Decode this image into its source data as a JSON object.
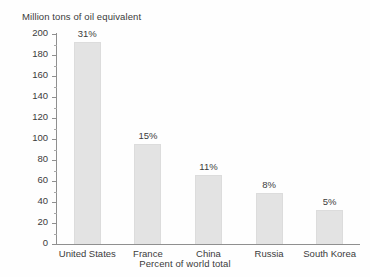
{
  "chart_data": {
    "type": "bar",
    "title": "",
    "ylabel": "Million tons of oil equivalent",
    "xlabel": "Percent of world total",
    "categories": [
      "United States",
      "France",
      "China",
      "Russia",
      "South Korea"
    ],
    "values": [
      192,
      95,
      66,
      49,
      32
    ],
    "data_labels": [
      "31%",
      "15%",
      "11%",
      "8%",
      "5%"
    ],
    "ylim": [
      0,
      200
    ],
    "ytick_labels": [
      "200",
      "180",
      "160",
      "140",
      "120",
      "100",
      "80",
      "60",
      "40",
      "20",
      "0"
    ],
    "ytick_values": [
      200,
      180,
      160,
      140,
      120,
      100,
      80,
      60,
      40,
      20,
      0
    ],
    "minor_tick_step": 10,
    "grid": false,
    "legend": null,
    "bar_color": "#e3e3e3",
    "axis_color": "#8f8f8f",
    "text_color": "#3b3b3b",
    "background": "#fefefe"
  }
}
